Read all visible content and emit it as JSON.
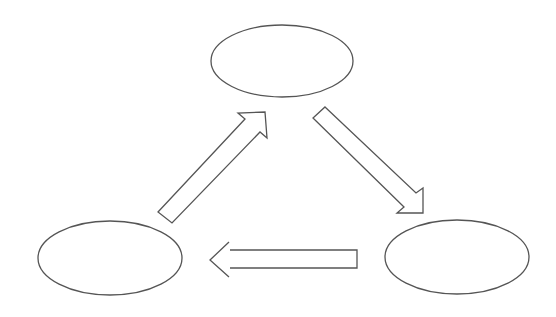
{
  "diagram": {
    "type": "cycle",
    "stroke_color": "#555555",
    "background": "#ffffff",
    "nodes": [
      {
        "id": "top",
        "label": "",
        "cx": 282,
        "cy": 61,
        "rx": 71,
        "ry": 36
      },
      {
        "id": "bottom-left",
        "label": "",
        "cx": 110,
        "cy": 258,
        "rx": 72,
        "ry": 37
      },
      {
        "id": "bottom-right",
        "label": "",
        "cx": 457,
        "cy": 257,
        "rx": 72,
        "ry": 37
      }
    ],
    "edges": [
      {
        "from": "bottom-left",
        "to": "top",
        "style": "hollow-block-arrow"
      },
      {
        "from": "top",
        "to": "bottom-right",
        "style": "hollow-block-arrow"
      },
      {
        "from": "bottom-right",
        "to": "bottom-left",
        "style": "hollow-block-arrow"
      }
    ]
  }
}
